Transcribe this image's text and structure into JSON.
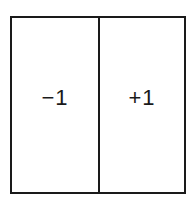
{
  "diagram": {
    "cells": [
      {
        "label": "−1"
      },
      {
        "label": "+1"
      }
    ],
    "colors": {
      "line": "#1a1a1a",
      "background": "#ffffff"
    }
  }
}
